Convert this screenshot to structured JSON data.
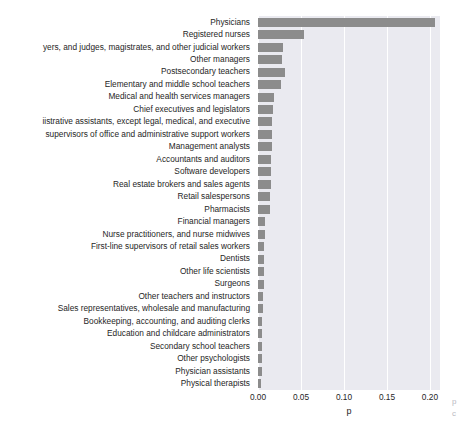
{
  "chart_data": {
    "type": "bar",
    "orientation": "horizontal",
    "title": "",
    "xlabel": "p",
    "ylabel": "",
    "xlim": [
      0.0,
      0.2117
    ],
    "xticks": [
      "0.00",
      "0.05",
      "0.10",
      "0.15",
      "0.20"
    ],
    "xtick_values": [
      0.0,
      0.05,
      0.1,
      0.15,
      0.2
    ],
    "grid": true,
    "grid_axis": "x",
    "legend": null,
    "bar_color": "#8c8c8c",
    "axes_background": "#eaeaf0",
    "categories": [
      "Physicians",
      "Registered nurses",
      "yers, and judges, magistrates, and other judicial workers",
      "Other managers",
      "Postsecondary teachers",
      "Elementary and middle school teachers",
      "Medical and health services managers",
      "Chief executives and legislators",
      "iistrative assistants, except legal, medical, and  executive",
      "supervisors of office and administrative support workers",
      "Management analysts",
      "Accountants and auditors",
      "Software developers",
      "Real estate brokers and sales agents",
      "Retail salespersons",
      "Pharmacists",
      "Financial managers",
      "Nurse practitioners, and nurse midwives",
      "First-line supervisors of retail sales workers",
      "Dentists",
      "Other life scientists",
      "Surgeons",
      "Other teachers and instructors",
      "Sales representatives, wholesale and manufacturing",
      "Bookkeeping, accounting, and auditing clerks",
      "Education and childcare administrators",
      "Secondary school teachers",
      "Other psychologists",
      "Physician assistants",
      "Physical therapists"
    ],
    "values": [
      0.2062,
      0.0531,
      0.0294,
      0.0279,
      0.0314,
      0.0269,
      0.0186,
      0.0174,
      0.0163,
      0.0163,
      0.0163,
      0.0157,
      0.0151,
      0.0151,
      0.0145,
      0.0134,
      0.0081,
      0.0076,
      0.007,
      0.007,
      0.0064,
      0.0064,
      0.0058,
      0.0058,
      0.0052,
      0.0047,
      0.0047,
      0.0041,
      0.0041,
      0.0035
    ]
  },
  "edge_fragments": [
    "p",
    "c"
  ]
}
